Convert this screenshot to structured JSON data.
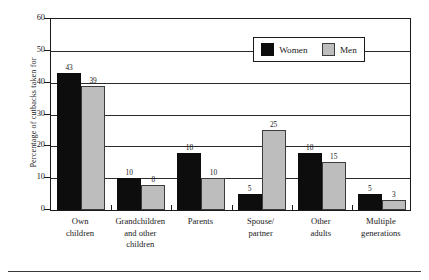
{
  "chart_data": {
    "type": "bar",
    "title": "",
    "xlabel": "",
    "ylabel": "Percentage of cutbacks taken for",
    "ylim": [
      0,
      60
    ],
    "ytick_labels": [
      "0",
      "10",
      "20",
      "30",
      "40",
      "50",
      "60"
    ],
    "ytick_values": [
      0,
      10,
      20,
      30,
      40,
      50,
      60
    ],
    "grid": "horizontal",
    "legend_position": "top-right-inside",
    "categories": [
      "Own children",
      "Grandchildren and other children",
      "Parents",
      "Spouse/ partner",
      "Other adults",
      "Multiple generations"
    ],
    "category_lines": [
      [
        "Own",
        "children"
      ],
      [
        "Grandchildren",
        "and other",
        "children"
      ],
      [
        "Parents"
      ],
      [
        "Spouse/",
        "partner"
      ],
      [
        "Other",
        "adults"
      ],
      [
        "Multiple",
        "generations"
      ]
    ],
    "series": [
      {
        "name": "Women",
        "color": "#0d0d0d",
        "values": [
          43,
          10,
          18,
          5,
          18,
          5
        ],
        "value_labels": [
          "43",
          "10",
          "18",
          "5",
          "18",
          "5"
        ]
      },
      {
        "name": "Men",
        "color": "#bdbdbd",
        "values": [
          39,
          8,
          10,
          25,
          15,
          3
        ],
        "value_labels": [
          "39",
          "8",
          "10",
          "25",
          "15",
          "3"
        ]
      }
    ]
  },
  "legend": {
    "entries": [
      {
        "label": "Women",
        "swatch": "black-square-swatch"
      },
      {
        "label": "Men",
        "swatch": "gray-square-swatch"
      }
    ]
  }
}
